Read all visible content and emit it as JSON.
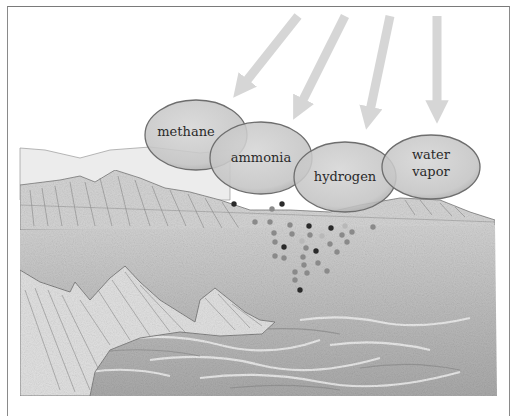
{
  "figure": {
    "gases": [
      {
        "label_lines": [
          "methane"
        ],
        "cx": 196,
        "cy": 135,
        "rx": 51,
        "ry": 35
      },
      {
        "label_lines": [
          "ammonia"
        ],
        "cx": 261,
        "cy": 158,
        "rx": 51,
        "ry": 36
      },
      {
        "label_lines": [
          "hydrogen"
        ],
        "cx": 345,
        "cy": 177,
        "rx": 51,
        "ry": 35
      },
      {
        "label_lines": [
          "water",
          "vapor"
        ],
        "cx": 431,
        "cy": 167,
        "rx": 49,
        "ry": 32
      }
    ],
    "arrows": [
      {
        "name": "energy-arrow-1",
        "x1": 298,
        "y1": 16,
        "x2": 233,
        "y2": 98
      },
      {
        "name": "energy-arrow-2",
        "x1": 345,
        "y1": 16,
        "x2": 293,
        "y2": 120
      },
      {
        "name": "energy-arrow-3",
        "x1": 390,
        "y1": 16,
        "x2": 366,
        "y2": 130
      },
      {
        "name": "energy-arrow-4",
        "x1": 437,
        "y1": 16,
        "x2": 437,
        "y2": 124
      }
    ],
    "colors": {
      "arrow": "#d6d6d6",
      "ellipse_fill": "#c9c9c9",
      "ellipse_stroke": "#6e6e6e",
      "sea": "#bdbdbd",
      "cliff": "#d9d9d9",
      "dot_dark": "#2a2a2a",
      "dot_mid": "#8a8a8a",
      "dot_light": "#b8b8b8"
    },
    "molecule_dots": [
      {
        "x": 234,
        "y": 204,
        "t": "dark"
      },
      {
        "x": 272,
        "y": 209,
        "t": "mid"
      },
      {
        "x": 282,
        "y": 204,
        "t": "dark"
      },
      {
        "x": 255,
        "y": 222,
        "t": "mid"
      },
      {
        "x": 270,
        "y": 222,
        "t": "mid"
      },
      {
        "x": 290,
        "y": 225,
        "t": "mid"
      },
      {
        "x": 309,
        "y": 226,
        "t": "dark"
      },
      {
        "x": 331,
        "y": 228,
        "t": "dark"
      },
      {
        "x": 345,
        "y": 226,
        "t": "light"
      },
      {
        "x": 373,
        "y": 227,
        "t": "mid"
      },
      {
        "x": 274,
        "y": 233,
        "t": "mid"
      },
      {
        "x": 292,
        "y": 234,
        "t": "mid"
      },
      {
        "x": 310,
        "y": 235,
        "t": "mid"
      },
      {
        "x": 322,
        "y": 236,
        "t": "light"
      },
      {
        "x": 342,
        "y": 235,
        "t": "mid"
      },
      {
        "x": 352,
        "y": 232,
        "t": "mid"
      },
      {
        "x": 275,
        "y": 242,
        "t": "mid"
      },
      {
        "x": 284,
        "y": 247,
        "t": "dark"
      },
      {
        "x": 302,
        "y": 241,
        "t": "light"
      },
      {
        "x": 306,
        "y": 248,
        "t": "mid"
      },
      {
        "x": 316,
        "y": 251,
        "t": "dark"
      },
      {
        "x": 330,
        "y": 244,
        "t": "mid"
      },
      {
        "x": 347,
        "y": 242,
        "t": "mid"
      },
      {
        "x": 337,
        "y": 252,
        "t": "mid"
      },
      {
        "x": 275,
        "y": 256,
        "t": "mid"
      },
      {
        "x": 284,
        "y": 258,
        "t": "mid"
      },
      {
        "x": 303,
        "y": 257,
        "t": "mid"
      },
      {
        "x": 304,
        "y": 265,
        "t": "mid"
      },
      {
        "x": 318,
        "y": 263,
        "t": "mid"
      },
      {
        "x": 327,
        "y": 271,
        "t": "mid"
      },
      {
        "x": 295,
        "y": 272,
        "t": "mid"
      },
      {
        "x": 307,
        "y": 273,
        "t": "mid"
      },
      {
        "x": 295,
        "y": 280,
        "t": "mid"
      },
      {
        "x": 300,
        "y": 290,
        "t": "dark"
      }
    ]
  }
}
